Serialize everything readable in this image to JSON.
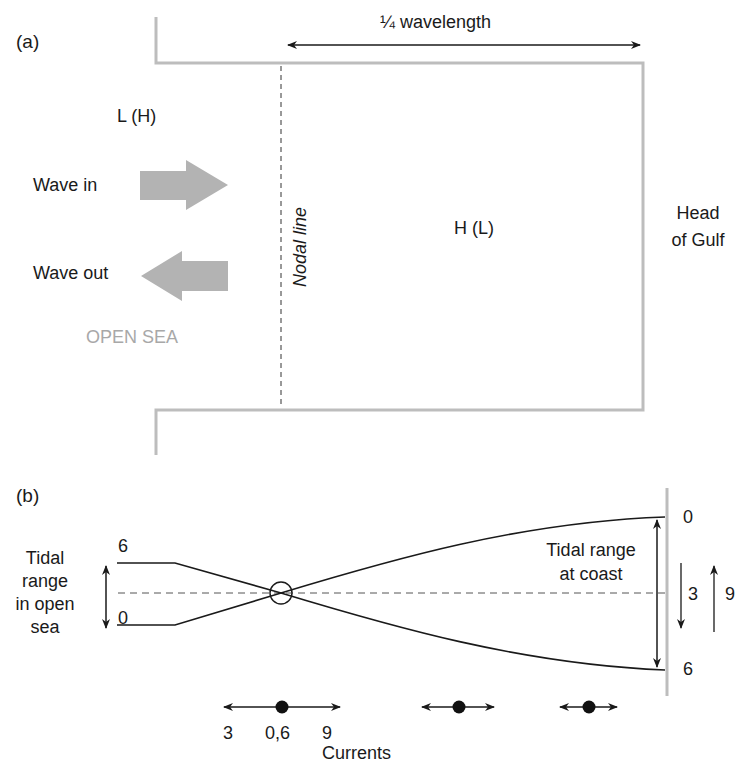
{
  "panel_a": {
    "label": "(a)",
    "wavelength_label": "¼ wavelength",
    "open_sea_low_high": "L (H)",
    "gulf_high_low": "H (L)",
    "wave_in": "Wave in",
    "wave_out": "Wave out",
    "open_sea": "OPEN SEA",
    "nodal_line": "Nodal line",
    "head_of_gulf_line1": "Head",
    "head_of_gulf_line2": "of Gulf"
  },
  "panel_b": {
    "label": "(b)",
    "open_sea_range_lines": [
      "Tidal",
      "range",
      "in open",
      "sea"
    ],
    "open_sea_top_value": "6",
    "open_sea_bottom_value": "0",
    "coast_range_lines": [
      "Tidal range",
      "at coast"
    ],
    "coast_top_value": "0",
    "coast_bottom_value": "6",
    "coast_down_value": "3",
    "coast_up_value": "9",
    "currents": {
      "left_value": "3",
      "center_value": "0,6",
      "right_value": "9",
      "title": "Currents"
    }
  },
  "colors": {
    "outline_gray": "#bdbdbd",
    "arrow_gray": "#b3b3b3",
    "ink": "#1a1a1a"
  }
}
